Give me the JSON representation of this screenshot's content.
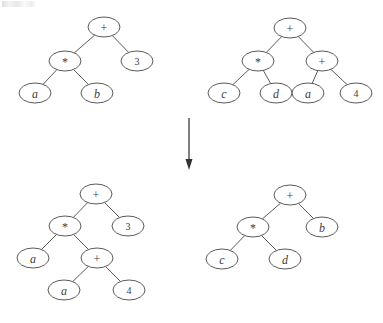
{
  "figure": {
    "type": "expression-tree-transformation-diagram",
    "background_color": "#ffffff",
    "stroke_color": "#5a5a5a",
    "text_color": "#3c3c3c",
    "node_shape": "ellipse",
    "node_rx": 16,
    "node_ry": 10
  },
  "arrow": {
    "name": "transformation-arrow",
    "direction": "down",
    "x": 189,
    "y_start": 118,
    "y_end": 170,
    "color": "#4a4a4a"
  },
  "trees": [
    {
      "id": "top-left",
      "name": "tree-top-left",
      "expression": "a * b + 3",
      "origin": {
        "x": 0,
        "y": 0
      },
      "nodes": [
        {
          "id": "tl-n0",
          "label": "+",
          "kind": "op",
          "x": 104,
          "y": 27
        },
        {
          "id": "tl-n1",
          "label": "*",
          "kind": "op",
          "x": 65,
          "y": 61
        },
        {
          "id": "tl-n2",
          "label": "3",
          "kind": "num",
          "x": 137,
          "y": 61
        },
        {
          "id": "tl-n3",
          "label": "a",
          "kind": "ident",
          "x": 35,
          "y": 93
        },
        {
          "id": "tl-n4",
          "label": "b",
          "kind": "ident",
          "x": 97,
          "y": 93
        }
      ],
      "edges": [
        {
          "from": "tl-n0",
          "to": "tl-n1"
        },
        {
          "from": "tl-n0",
          "to": "tl-n2"
        },
        {
          "from": "tl-n1",
          "to": "tl-n3"
        },
        {
          "from": "tl-n1",
          "to": "tl-n4"
        }
      ]
    },
    {
      "id": "top-right",
      "name": "tree-top-right",
      "expression": "c * d + (a + 4)",
      "origin": {
        "x": 0,
        "y": 0
      },
      "nodes": [
        {
          "id": "tr-n0",
          "label": "+",
          "kind": "op",
          "x": 290,
          "y": 28
        },
        {
          "id": "tr-n1",
          "label": "*",
          "kind": "op",
          "x": 258,
          "y": 61
        },
        {
          "id": "tr-n2",
          "label": "+",
          "kind": "op",
          "x": 322,
          "y": 61
        },
        {
          "id": "tr-n3",
          "label": "c",
          "kind": "ident",
          "x": 224,
          "y": 93
        },
        {
          "id": "tr-n4",
          "label": "d",
          "kind": "ident",
          "x": 276,
          "y": 93
        },
        {
          "id": "tr-n5",
          "label": "a",
          "kind": "ident",
          "x": 308,
          "y": 93
        },
        {
          "id": "tr-n6",
          "label": "4",
          "kind": "num",
          "x": 356,
          "y": 93
        }
      ],
      "edges": [
        {
          "from": "tr-n0",
          "to": "tr-n1"
        },
        {
          "from": "tr-n0",
          "to": "tr-n2"
        },
        {
          "from": "tr-n1",
          "to": "tr-n3"
        },
        {
          "from": "tr-n1",
          "to": "tr-n4"
        },
        {
          "from": "tr-n2",
          "to": "tr-n5"
        },
        {
          "from": "tr-n2",
          "to": "tr-n6"
        }
      ]
    },
    {
      "id": "bottom-left",
      "name": "tree-bottom-left",
      "expression": "a * (a + 4) + 3",
      "origin": {
        "x": 0,
        "y": 0
      },
      "nodes": [
        {
          "id": "bl-n0",
          "label": "+",
          "kind": "op",
          "x": 96,
          "y": 194
        },
        {
          "id": "bl-n1",
          "label": "*",
          "kind": "op",
          "x": 65,
          "y": 226
        },
        {
          "id": "bl-n2",
          "label": "3",
          "kind": "num",
          "x": 128,
          "y": 226
        },
        {
          "id": "bl-n3",
          "label": "a",
          "kind": "ident",
          "x": 33,
          "y": 258
        },
        {
          "id": "bl-n4",
          "label": "+",
          "kind": "op",
          "x": 97,
          "y": 258
        },
        {
          "id": "bl-n5",
          "label": "a",
          "kind": "ident",
          "x": 64,
          "y": 290
        },
        {
          "id": "bl-n6",
          "label": "4",
          "kind": "num",
          "x": 129,
          "y": 290
        }
      ],
      "edges": [
        {
          "from": "bl-n0",
          "to": "bl-n1"
        },
        {
          "from": "bl-n0",
          "to": "bl-n2"
        },
        {
          "from": "bl-n1",
          "to": "bl-n3"
        },
        {
          "from": "bl-n1",
          "to": "bl-n4"
        },
        {
          "from": "bl-n4",
          "to": "bl-n5"
        },
        {
          "from": "bl-n4",
          "to": "bl-n6"
        }
      ]
    },
    {
      "id": "bottom-right",
      "name": "tree-bottom-right",
      "expression": "c * d + b",
      "origin": {
        "x": 0,
        "y": 0
      },
      "nodes": [
        {
          "id": "br-n0",
          "label": "+",
          "kind": "op",
          "x": 290,
          "y": 195
        },
        {
          "id": "br-n1",
          "label": "*",
          "kind": "op",
          "x": 253,
          "y": 227
        },
        {
          "id": "br-n2",
          "label": "b",
          "kind": "ident",
          "x": 322,
          "y": 227
        },
        {
          "id": "br-n3",
          "label": "c",
          "kind": "ident",
          "x": 222,
          "y": 259
        },
        {
          "id": "br-n4",
          "label": "d",
          "kind": "ident",
          "x": 285,
          "y": 259
        }
      ],
      "edges": [
        {
          "from": "br-n0",
          "to": "br-n1"
        },
        {
          "from": "br-n0",
          "to": "br-n2"
        },
        {
          "from": "br-n1",
          "to": "br-n3"
        },
        {
          "from": "br-n1",
          "to": "br-n4"
        }
      ]
    }
  ]
}
